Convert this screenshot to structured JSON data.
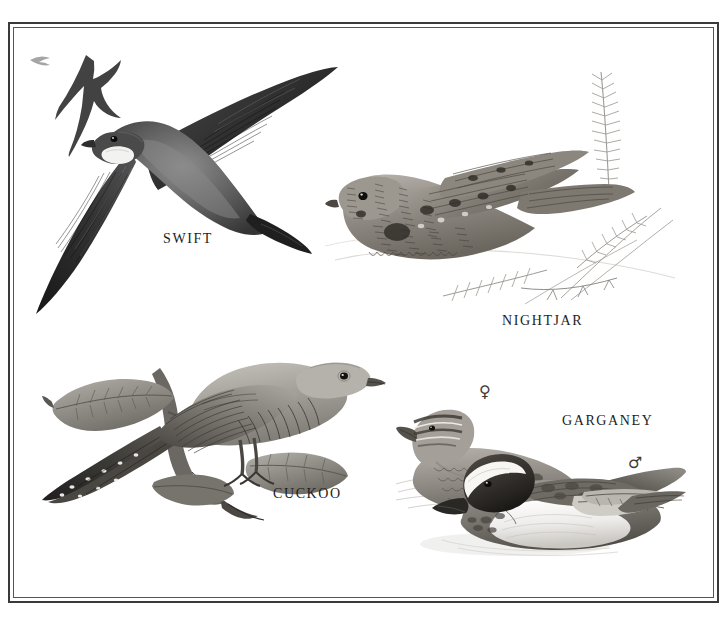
{
  "plate": {
    "title": "Bird illustration plate",
    "background_color": "#ffffff",
    "frame": {
      "style": "double-rule",
      "outer_color": "#3a3a3a",
      "inner_color": "#555555"
    },
    "medium": "graphite / pencil illustration, monochrome"
  },
  "labels": {
    "swift": "SWIFT",
    "nightjar": "NIGHTJAR",
    "cuckoo": "CUCKOO",
    "garganey": "GARGANEY"
  },
  "symbols": {
    "female": "♀",
    "male": "♂"
  },
  "illustrations": [
    {
      "id": "swift",
      "label": "SWIFT",
      "description": "Common Swift in flight, wings swept back in crescent, pale throat patch, dark sooty plumage, with two smaller swifts silhouetted in the distance behind.",
      "position": "top-left"
    },
    {
      "id": "nightjar",
      "label": "NIGHTJAR",
      "description": "European Nightjar roosting on the ground among bracken fronds and grass stems, cryptic mottled brown and grey barred plumage, long tail and wings.",
      "position": "top-right"
    },
    {
      "id": "cuckoo",
      "label": "CUCKOO",
      "description": "Common Cuckoo perched on a leafy branch, grey head and back, barred white underparts, long white-spotted tail.",
      "position": "bottom-left"
    },
    {
      "id": "garganey",
      "label": "GARGANEY",
      "description": "Pair of Garganey ducks swimming; female behind with plain mottled brown plumage and striped face, male in front with broad white supercilium stripe over dark head and drooping scapulars.",
      "position": "bottom-right",
      "sexes": [
        "♀",
        "♂"
      ]
    }
  ]
}
